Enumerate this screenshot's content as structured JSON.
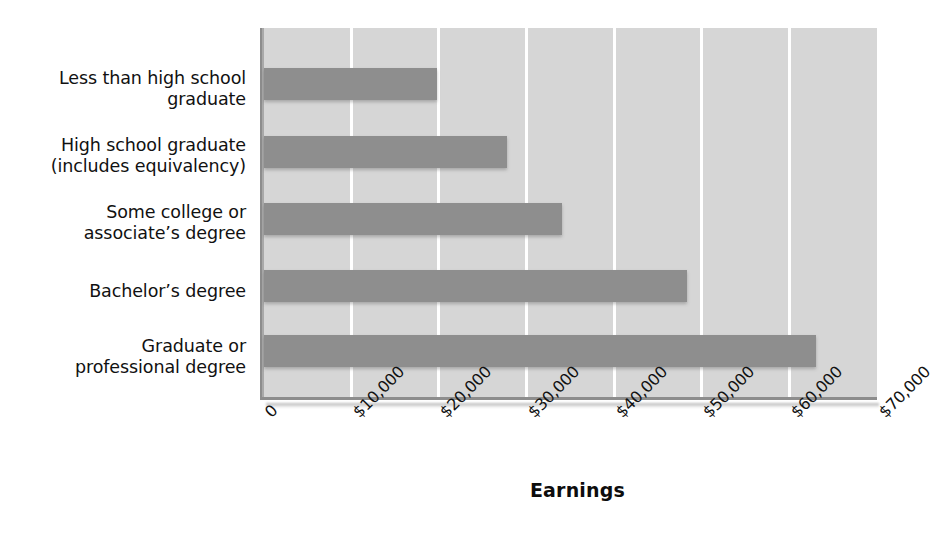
{
  "chart_data": {
    "type": "bar",
    "orientation": "horizontal",
    "title": "",
    "xlabel": "Earnings",
    "ylabel": "",
    "categories": [
      "Less than high school\ngraduate",
      "High school graduate\n(includes equivalency)",
      "Some college or\nassociate’s degree",
      "Bachelor’s degree",
      "Graduate or\nprofessional degree"
    ],
    "values": [
      19750,
      27700,
      34000,
      48300,
      63000
    ],
    "xlim": [
      0,
      70000
    ],
    "xticks": [
      0,
      10000,
      20000,
      30000,
      40000,
      50000,
      60000,
      70000
    ],
    "xticklabels": [
      "0",
      "$10,000",
      "$20,000",
      "$30,000",
      "$40,000",
      "$50,000",
      "$60,000",
      "$70,000"
    ],
    "grid": true,
    "grid_axis": "x",
    "legend": false,
    "bar_color": "#8e8e8e",
    "plot_background": "#d6d6d6",
    "gridline_color": "#ffffff",
    "axis_color": "#8d8d8d",
    "text_color": "#111111",
    "tick_label_rotation": -45
  }
}
